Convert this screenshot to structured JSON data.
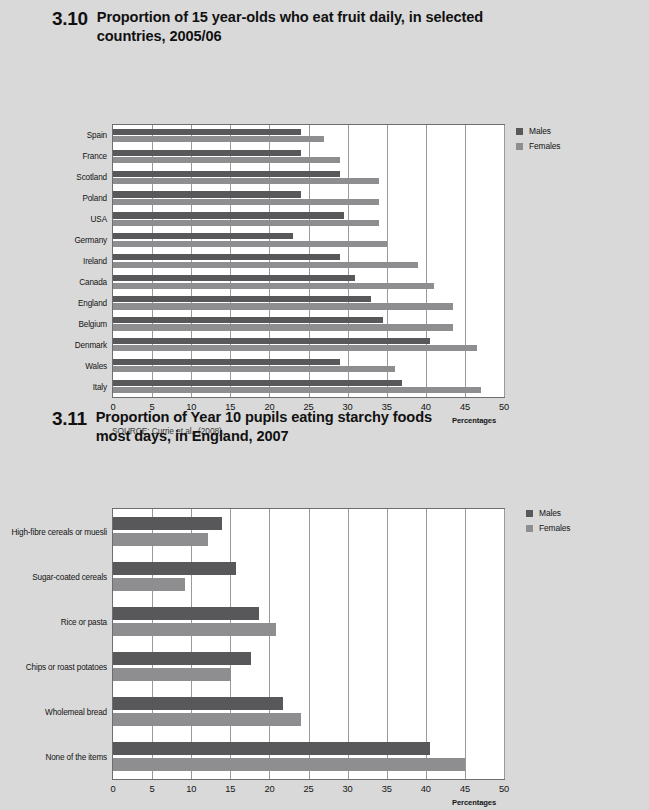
{
  "page": {
    "background": "#d9d9d9"
  },
  "colors": {
    "males": "#58585a",
    "females": "#8e8e90",
    "grid": "#9a9a9a",
    "frame": "#6d6d6d"
  },
  "figures": [
    {
      "number": "3.10",
      "title_line1": "Proportion of 15 year-olds who eat fruit daily, in selected",
      "title_line2": "countries, 2005/06",
      "source": "SOURCE: Currie et al., (2008).",
      "legend": [
        {
          "label": "Males",
          "color": "#58585a"
        },
        {
          "label": "Females",
          "color": "#8e8e90"
        }
      ],
      "axis_title": "Percentages",
      "chart_data": {
        "type": "bar",
        "orientation": "horizontal",
        "title": "Proportion of 15 year-olds who eat fruit daily, in selected countries, 2005/06",
        "xlabel": "Percentages",
        "ylabel": "",
        "xlim": [
          0,
          50
        ],
        "xticks": [
          0,
          5,
          10,
          15,
          20,
          25,
          30,
          35,
          40,
          45,
          50
        ],
        "grid": true,
        "legend_position": "top-right",
        "categories": [
          "Spain",
          "France",
          "Scotland",
          "Poland",
          "USA",
          "Germany",
          "Ireland",
          "Canada",
          "England",
          "Belgium",
          "Denmark",
          "Wales",
          "Italy"
        ],
        "series": [
          {
            "name": "Males",
            "color": "#58585a",
            "values": [
              24,
              24,
              29,
              24,
              29.5,
              23,
              29,
              31,
              33,
              34.5,
              40.5,
              29,
              37
            ]
          },
          {
            "name": "Females",
            "color": "#8e8e90",
            "values": [
              27,
              29,
              34,
              34,
              34,
              35,
              39,
              41,
              43.5,
              43.5,
              46.5,
              36,
              47
            ]
          }
        ]
      }
    },
    {
      "number": "3.11",
      "title_line1": "Proportion of Year 10 pupils eating starchy foods",
      "title_line2": "most days, in England, 2007",
      "source": "SOURCE: Balding (2007).",
      "legend": [
        {
          "label": "Males",
          "color": "#58585a"
        },
        {
          "label": "Females",
          "color": "#8e8e90"
        }
      ],
      "axis_title": "Percentages",
      "chart_data": {
        "type": "bar",
        "orientation": "horizontal",
        "title": "Proportion of Year 10 pupils eating starchy foods most days, in England, 2007",
        "xlabel": "Percentages",
        "ylabel": "",
        "xlim": [
          0,
          50
        ],
        "xticks": [
          0,
          5,
          10,
          15,
          20,
          25,
          30,
          35,
          40,
          45,
          50
        ],
        "grid": true,
        "legend_position": "top-right",
        "categories": [
          "High-fibre cereals or muesli",
          "Sugar-coated cereals",
          "Rice or pasta",
          "Chips or roast potatoes",
          "Wholemeal bread",
          "None of the items"
        ],
        "series": [
          {
            "name": "Males",
            "color": "#58585a",
            "values": [
              14,
              15.7,
              18.7,
              17.7,
              21.8,
              40.5
            ]
          },
          {
            "name": "Females",
            "color": "#8e8e90",
            "values": [
              12.1,
              9.2,
              20.8,
              15.1,
              24,
              45
            ]
          }
        ]
      }
    }
  ]
}
